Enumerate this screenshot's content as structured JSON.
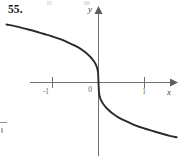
{
  "figure": {
    "exercise_number": "55.",
    "background_color": "#ffffff",
    "curve_color": "#2b2b2b",
    "axis_color": "#6f6f6f"
  },
  "labels": {
    "y_axis": "y",
    "x_axis": "x",
    "origin": "0",
    "tick_neg_one": "-1",
    "tick_pos_one": "1"
  },
  "chart_data": {
    "type": "line",
    "title": "55.",
    "xlabel": "x",
    "ylabel": "y",
    "xlim": [
      -2.05,
      1.75
    ],
    "ylim": [
      -1.95,
      1.55
    ],
    "xticks": [
      -1,
      1
    ],
    "xticklabels": [
      "-1",
      "1"
    ],
    "yticks": [],
    "yticklabels": [],
    "grid": false,
    "legend": null,
    "annotations": [
      "0"
    ],
    "series": [
      {
        "name": "y = -x^(1/3)",
        "x": [
          -2.0,
          -1.8,
          -1.6,
          -1.4,
          -1.2,
          -1.0,
          -0.8,
          -0.6,
          -0.45,
          -0.3,
          -0.18,
          -0.1,
          -0.045,
          -0.012,
          0.0,
          0.012,
          0.045,
          0.1,
          0.18,
          0.3,
          0.45,
          0.6,
          0.8,
          1.0,
          1.2,
          1.4,
          1.55,
          1.7
        ],
        "y": [
          1.26,
          1.22,
          1.17,
          1.12,
          1.06,
          1.0,
          0.93,
          0.84,
          0.77,
          0.67,
          0.56,
          0.46,
          0.36,
          0.23,
          0.0,
          -0.23,
          -0.36,
          -0.46,
          -0.56,
          -0.67,
          -0.77,
          -0.84,
          -0.93,
          -1.0,
          -1.06,
          -1.12,
          -1.16,
          -1.19
        ]
      }
    ]
  }
}
